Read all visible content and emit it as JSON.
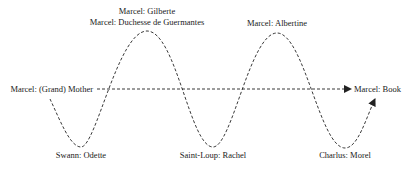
{
  "diagram": {
    "type": "oscillating-relationship-wave",
    "line_color": "#222222",
    "labels": {
      "peak_1_top": "Marcel: Gilberte",
      "peak_1_bottom": "Marcel: Duchesse de Guermantes",
      "peak_2": "Marcel: Albertine",
      "start": "Marcel: (Grand) Mother",
      "end": "Marcel: Book",
      "trough_1": "Swann: Odette",
      "trough_2": "Saint-Loup: Rachel",
      "trough_3": "Charlus: Morel"
    },
    "nodes": [
      {
        "id": "start",
        "label": "Marcel: (Grand) Mother",
        "position": "axis-left"
      },
      {
        "id": "trough_1",
        "label": "Swann: Odette",
        "position": "trough"
      },
      {
        "id": "peak_1",
        "label": "Marcel: Gilberte / Marcel: Duchesse de Guermantes",
        "position": "peak"
      },
      {
        "id": "trough_2",
        "label": "Saint-Loup: Rachel",
        "position": "trough"
      },
      {
        "id": "peak_2",
        "label": "Marcel: Albertine",
        "position": "peak"
      },
      {
        "id": "trough_3",
        "label": "Charlus: Morel",
        "position": "trough"
      },
      {
        "id": "end",
        "label": "Marcel: Book",
        "position": "axis-right"
      }
    ],
    "edges": [
      {
        "from": "start",
        "to": "end",
        "style": "dashed-straight-arrow"
      },
      {
        "from": "start",
        "to": "end",
        "style": "dashed-wave-arrow",
        "via": [
          "trough_1",
          "peak_1",
          "trough_2",
          "peak_2",
          "trough_3"
        ]
      }
    ]
  }
}
